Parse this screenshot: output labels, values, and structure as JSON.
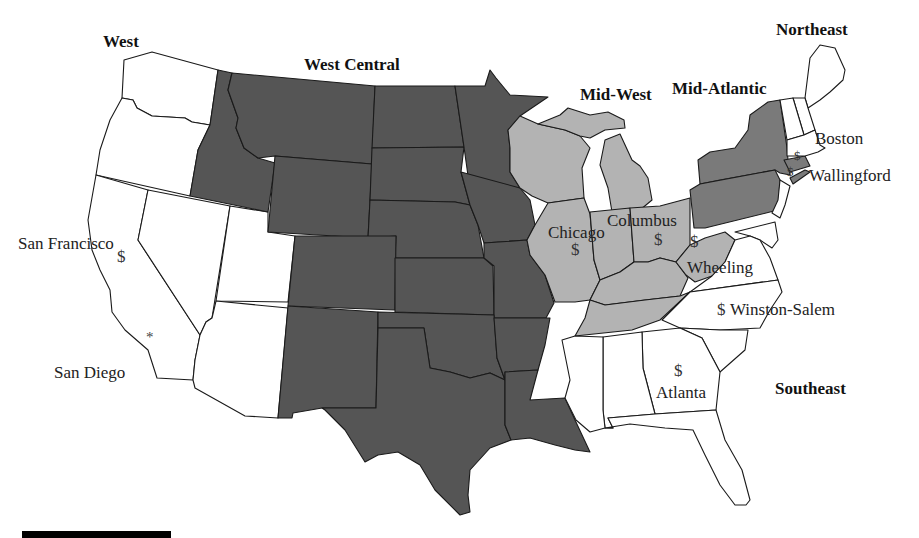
{
  "map": {
    "colors": {
      "west_central": "#555555",
      "mid_west": "#b3b3b3",
      "mid_atlantic": "#7a7a7a",
      "unshaded": "#ffffff",
      "border": "#1a1a1a"
    },
    "regions": [
      {
        "id": "west",
        "label": "West"
      },
      {
        "id": "west_central",
        "label": "West Central"
      },
      {
        "id": "mid_west",
        "label": "Mid-West"
      },
      {
        "id": "mid_atlantic",
        "label": "Mid-Atlantic"
      },
      {
        "id": "northeast",
        "label": "Northeast"
      },
      {
        "id": "southeast",
        "label": "Southeast"
      }
    ],
    "cities": [
      {
        "name": "San Francisco",
        "marker": "$"
      },
      {
        "name": "San Diego",
        "marker": "*"
      },
      {
        "name": "Chicago",
        "marker": "$"
      },
      {
        "name": "Columbus",
        "marker": "$"
      },
      {
        "name": "Wheeling",
        "marker": "$"
      },
      {
        "name": "Boston",
        "marker": "$"
      },
      {
        "name": "Wallingford",
        "marker": "$"
      },
      {
        "name": "Winston-Salem",
        "marker": "$"
      },
      {
        "name": "Atlanta",
        "marker": "$"
      }
    ]
  }
}
